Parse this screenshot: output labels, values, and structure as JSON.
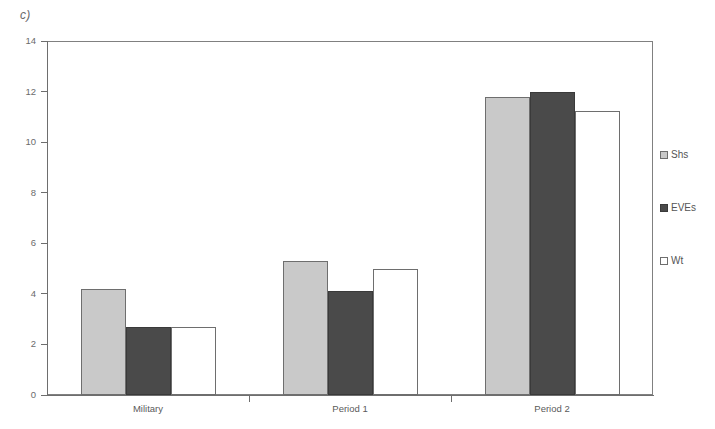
{
  "panel": {
    "label": "c)"
  },
  "chart_data": {
    "type": "bar",
    "title": "",
    "xlabel": "",
    "ylabel": "",
    "ylim": [
      0,
      14
    ],
    "ytick_step": 2,
    "yticks": [
      "0",
      "2",
      "4",
      "6",
      "8",
      "10",
      "12",
      "14"
    ],
    "grid": false,
    "legend_position": "right",
    "categories": [
      "Military",
      "Period 1",
      "Period 2"
    ],
    "series": [
      {
        "name": "Shs",
        "color": "#c9c9c9",
        "values": [
          4.2,
          5.3,
          11.8
        ]
      },
      {
        "name": "EVEs",
        "color": "#4a4a4a",
        "values": [
          2.7,
          4.1,
          12.0
        ]
      },
      {
        "name": "Wt",
        "color": "#ffffff",
        "values": [
          2.7,
          5.0,
          11.25
        ]
      }
    ]
  },
  "legend": {
    "items": [
      {
        "label": "Shs"
      },
      {
        "label": "EVEs"
      },
      {
        "label": "Wt"
      }
    ]
  },
  "colors": {
    "series_shs": "#c9c9c9",
    "series_eves": "#4a4a4a",
    "series_wt": "#ffffff",
    "axis": "#6e6e6e",
    "text": "#5a5a5a"
  }
}
